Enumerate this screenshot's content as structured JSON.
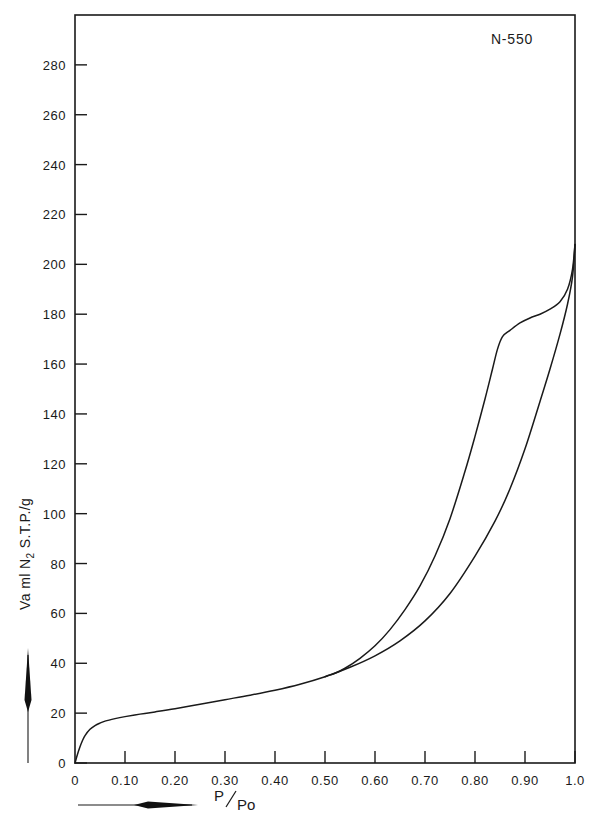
{
  "chart_data": {
    "type": "line",
    "title": "",
    "series_label": "N-550",
    "xlabel": "P/Po",
    "ylabel": "Va ml N2 S.T.P./g",
    "ylabel_parts": {
      "pre": "Va ml N",
      "sub": "2",
      "post": " S.T.P./g"
    },
    "xlabel_parts": {
      "numerator": "P",
      "denominator": "Po"
    },
    "xlim": [
      0,
      1.0
    ],
    "ylim": [
      0,
      300
    ],
    "grid": false,
    "legend_position": "top-right-inside",
    "xticks": [
      0,
      0.1,
      0.2,
      0.3,
      0.4,
      0.5,
      0.6,
      0.7,
      0.8,
      0.9,
      1.0
    ],
    "xticklabels": [
      "0",
      "0.10",
      "0.20",
      "0.30",
      "0.40",
      "0.50",
      "0.60",
      "0.70",
      "0.80",
      "0.90",
      "1.0"
    ],
    "yticks": [
      0,
      20,
      40,
      60,
      80,
      100,
      120,
      140,
      160,
      180,
      200,
      220,
      240,
      260,
      280
    ],
    "yticklabels": [
      "0",
      "20",
      "40",
      "60",
      "80",
      "100",
      "120",
      "140",
      "160",
      "180",
      "200",
      "220",
      "240",
      "260",
      "280"
    ],
    "series": [
      {
        "name": "adsorption",
        "x": [
          0.0,
          0.005,
          0.01,
          0.015,
          0.02,
          0.03,
          0.04,
          0.05,
          0.06,
          0.08,
          0.1,
          0.13,
          0.16,
          0.2,
          0.25,
          0.3,
          0.35,
          0.4,
          0.45,
          0.5,
          0.55,
          0.6,
          0.65,
          0.7,
          0.75,
          0.8,
          0.84,
          0.87,
          0.9,
          0.93,
          0.95,
          0.97,
          0.985,
          0.995,
          1.0
        ],
        "y": [
          0.0,
          3.5,
          6.5,
          9.0,
          11.0,
          13.5,
          15.0,
          16.0,
          16.8,
          17.8,
          18.6,
          19.6,
          20.5,
          21.8,
          23.6,
          25.4,
          27.2,
          29.2,
          31.6,
          34.6,
          38.4,
          43.0,
          49.0,
          57.0,
          68.0,
          83.0,
          97.0,
          110.0,
          126.0,
          145.0,
          158.0,
          172.0,
          184.0,
          195.0,
          208.0
        ]
      },
      {
        "name": "desorption",
        "x": [
          1.0,
          0.995,
          0.985,
          0.97,
          0.95,
          0.93,
          0.91,
          0.89,
          0.87,
          0.855,
          0.845,
          0.835,
          0.82,
          0.8,
          0.78,
          0.75,
          0.72,
          0.69,
          0.66,
          0.63,
          0.6,
          0.57,
          0.54,
          0.52,
          0.505,
          0.5
        ],
        "y": [
          208.0,
          198.0,
          190.0,
          185.0,
          182.0,
          180.0,
          178.5,
          176.5,
          173.5,
          171.0,
          166.0,
          158.0,
          146.0,
          131.0,
          117.0,
          98.0,
          83.0,
          71.0,
          61.5,
          53.5,
          47.0,
          42.0,
          38.0,
          36.0,
          35.0,
          34.6
        ]
      }
    ],
    "annotations": [
      {
        "name": "y-axis-direction-arrow",
        "direction": "up"
      },
      {
        "name": "x-axis-direction-arrow",
        "direction": "right"
      }
    ]
  }
}
